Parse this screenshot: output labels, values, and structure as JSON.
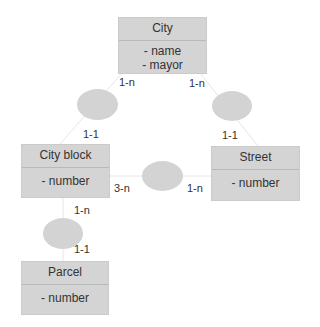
{
  "diagram": {
    "type": "entity-relationship",
    "entities": [
      {
        "id": "city",
        "name": "City",
        "attributes": [
          "- name",
          "- mayor"
        ]
      },
      {
        "id": "city_block",
        "name": "City block",
        "attributes": [
          "- number"
        ]
      },
      {
        "id": "street",
        "name": "Street",
        "attributes": [
          "- number"
        ]
      },
      {
        "id": "parcel",
        "name": "Parcel",
        "attributes": [
          "- number"
        ]
      }
    ],
    "relationships": [
      {
        "from": "City",
        "to": "City block",
        "card_from": "1-n",
        "card_to": "1-1"
      },
      {
        "from": "City",
        "to": "Street",
        "card_from": "1-n",
        "card_to": "1-1"
      },
      {
        "from": "City block",
        "to": "Street",
        "card_from": "3-n",
        "card_to": "1-n"
      },
      {
        "from": "City block",
        "to": "Parcel",
        "card_from": "1-n",
        "card_to": "1-1"
      }
    ],
    "colors": {
      "box": "#d4d4d4",
      "ellipse": "#d3d3d3",
      "line": "#e6e6e6"
    }
  }
}
